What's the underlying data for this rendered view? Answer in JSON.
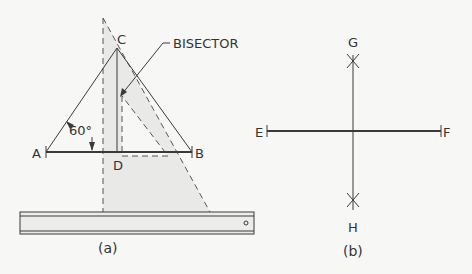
{
  "figure_a": {
    "caption": "(a)",
    "labels": {
      "A": "A",
      "B": "B",
      "C": "C",
      "D": "D",
      "angle": "60°",
      "leader": "BISECTOR"
    }
  },
  "figure_b": {
    "caption": "(b)",
    "labels": {
      "E": "E",
      "F": "F",
      "G": "G",
      "H": "H"
    }
  },
  "colors": {
    "background": "#f7f7f6",
    "ink": "#3a3a3a",
    "shade": "#e9e9e7"
  }
}
